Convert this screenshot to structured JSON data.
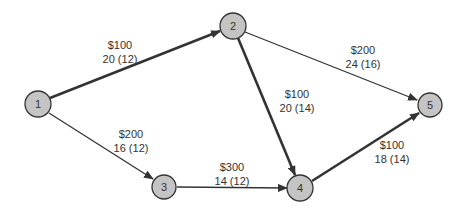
{
  "diagram": {
    "type": "network",
    "nodes": [
      {
        "id": "1",
        "label": "1",
        "x": 38,
        "y": 104
      },
      {
        "id": "2",
        "label": "2",
        "x": 233,
        "y": 26
      },
      {
        "id": "3",
        "label": "3",
        "x": 164,
        "y": 187
      },
      {
        "id": "4",
        "label": "4",
        "x": 300,
        "y": 188
      },
      {
        "id": "5",
        "label": "5",
        "x": 430,
        "y": 105
      }
    ],
    "edges": [
      {
        "from": "1",
        "to": "2",
        "cost": "$100",
        "time": "20 (12)",
        "critical": true
      },
      {
        "from": "1",
        "to": "3",
        "cost": "$200",
        "time": "16 (12)",
        "critical": false
      },
      {
        "from": "2",
        "to": "5",
        "cost": "$200",
        "time": "24 (16)",
        "critical": false
      },
      {
        "from": "2",
        "to": "4",
        "cost": "$100",
        "time": "20 (14)",
        "critical": true
      },
      {
        "from": "3",
        "to": "4",
        "cost": "$300",
        "time": "14 (12)",
        "critical": false
      },
      {
        "from": "4",
        "to": "5",
        "cost": "$100",
        "time": "18 (14)",
        "critical": true
      }
    ]
  },
  "colors": {
    "node_fill": "#c4c4c4",
    "node_stroke": "#333333",
    "edge": "#333333",
    "text": "#333333"
  }
}
